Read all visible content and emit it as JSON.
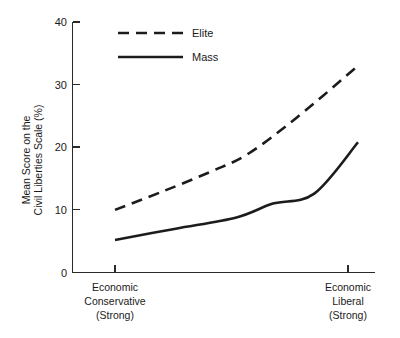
{
  "chart_data": {
    "type": "line",
    "title": "",
    "xlabel": "",
    "ylabel": "Mean Score on the Civil Liberties Scale (%)",
    "ylabel_line1": "Mean Score on the",
    "ylabel_line2": "Civil Liberties Scale (%)",
    "categories": [
      "Economic Conservative (Strong)",
      "Economic Liberal (Strong)"
    ],
    "category_labels": [
      {
        "line1": "Economic",
        "line2": "Conservative",
        "line3": "(Strong)"
      },
      {
        "line1": "Economic",
        "line2": "Liberal",
        "line3": "(Strong)"
      }
    ],
    "ylim": [
      0,
      40
    ],
    "yticks": [
      0,
      10,
      20,
      30,
      40
    ],
    "ytick_labels": [
      "0",
      "10",
      "20",
      "30",
      "40"
    ],
    "xlim": [
      0,
      1
    ],
    "grid": false,
    "legend_position": "top-center",
    "series": [
      {
        "name": "Elite",
        "style": "dashed",
        "color": "#1c1c1c",
        "x": [
          0.0,
          0.2,
          0.4,
          0.55,
          0.75,
          1.0
        ],
        "values": [
          10.0,
          13.0,
          16.2,
          19.0,
          24.8,
          33.0
        ]
      },
      {
        "name": "Mass",
        "style": "solid",
        "color": "#1c1c1c",
        "x": [
          0.0,
          0.25,
          0.5,
          0.65,
          0.82,
          1.0
        ],
        "values": [
          5.2,
          7.0,
          8.8,
          11.0,
          12.6,
          20.8
        ]
      }
    ],
    "legend": [
      {
        "label": "Elite",
        "style": "dashed"
      },
      {
        "label": "Mass",
        "style": "solid"
      }
    ]
  }
}
